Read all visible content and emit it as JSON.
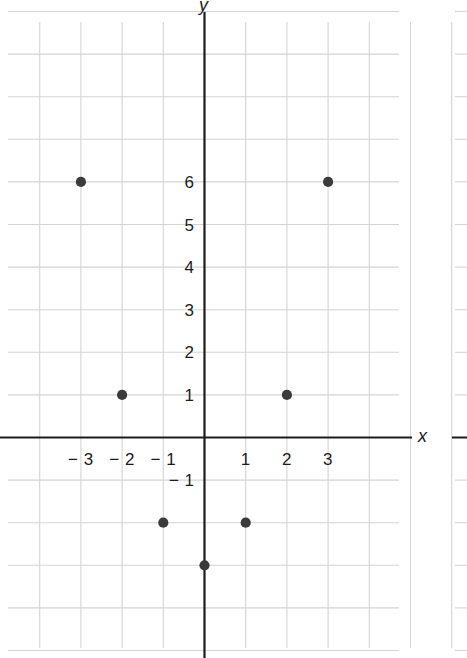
{
  "chart_data": {
    "type": "scatter",
    "title": "",
    "subtitle": "",
    "xlabel": "x",
    "ylabel": "y",
    "points": [
      {
        "x": -3,
        "y": 6
      },
      {
        "x": -2,
        "y": 1
      },
      {
        "x": -1,
        "y": -2
      },
      {
        "x": 0,
        "y": -3
      },
      {
        "x": 1,
        "y": -2
      },
      {
        "x": 2,
        "y": 1
      },
      {
        "x": 3,
        "y": 6
      }
    ],
    "xlim": [
      -4.9,
      6.4
    ],
    "ylim": [
      -5.1,
      10.1
    ],
    "x_tick_labels": [
      "− 3",
      "− 2",
      "− 1",
      "1",
      "2",
      "3"
    ],
    "x_tick_values": [
      -3,
      -2,
      -1,
      1,
      2,
      3
    ],
    "y_tick_labels": [
      "6",
      "5",
      "4",
      "3",
      "2",
      "1",
      "− 1"
    ],
    "y_tick_values": [
      6,
      5,
      4,
      3,
      2,
      1,
      -1
    ],
    "grid": true,
    "grid_step": 1,
    "legend": "none",
    "point_color": "#3b3b3b",
    "axis_color": "#1c1c1c",
    "grid_color": "#d4d4d4"
  },
  "axes": {
    "x_axis_label": "x",
    "y_axis_label": "y"
  }
}
